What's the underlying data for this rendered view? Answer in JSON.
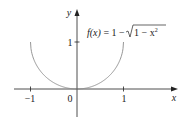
{
  "chart_data": {
    "type": "line",
    "title": "",
    "function_label": "f(x) = 1 − √(1 − x²)",
    "function_label_parts": {
      "lhs": "f(x)",
      "eq": " = 1 − ",
      "radicand": "1 − x",
      "exp": "2"
    },
    "xlabel": "x",
    "ylabel": "y",
    "x_ticks": [
      {
        "value": -1,
        "label": "−1"
      },
      {
        "value": 0,
        "label": "0"
      },
      {
        "value": 1,
        "label": "1"
      }
    ],
    "y_ticks": [
      {
        "value": 1,
        "label": "1"
      }
    ],
    "xlim": [
      -1.35,
      2.1
    ],
    "ylim": [
      -0.6,
      1.7
    ],
    "grid": false,
    "series": [
      {
        "name": "f(x) = 1 − √(1 − x²)",
        "domain": [
          -1,
          1
        ],
        "points": [
          [
            -1,
            1
          ],
          [
            -0.99,
            0.859
          ],
          [
            -0.95,
            0.688
          ],
          [
            -0.9,
            0.564
          ],
          [
            -0.8,
            0.4
          ],
          [
            -0.7,
            0.286
          ],
          [
            -0.6,
            0.2
          ],
          [
            -0.5,
            0.134
          ],
          [
            -0.4,
            0.083
          ],
          [
            -0.3,
            0.046
          ],
          [
            -0.2,
            0.02
          ],
          [
            -0.1,
            0.005
          ],
          [
            0,
            0
          ],
          [
            0.1,
            0.005
          ],
          [
            0.2,
            0.02
          ],
          [
            0.3,
            0.046
          ],
          [
            0.4,
            0.083
          ],
          [
            0.5,
            0.134
          ],
          [
            0.6,
            0.2
          ],
          [
            0.7,
            0.286
          ],
          [
            0.8,
            0.4
          ],
          [
            0.9,
            0.564
          ],
          [
            0.95,
            0.688
          ],
          [
            0.99,
            0.859
          ],
          [
            1,
            1
          ]
        ],
        "color": "#8a8a8a"
      }
    ],
    "colors": {
      "axis": "#222222",
      "curve": "#8a8a8a"
    }
  }
}
